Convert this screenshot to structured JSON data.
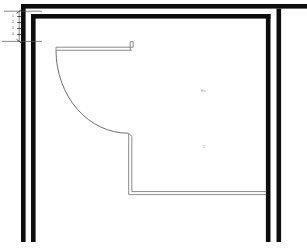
{
  "drawing": {
    "title": "architectural-floor-plan",
    "type": "plan-view",
    "background_color": "#ffffff",
    "wall_color": "#0d0d0d",
    "thin_line_color": "#8a8a8a",
    "dimension_color": "#4a4a4a"
  },
  "labels": {
    "room_tag_upper": "Ex",
    "room_tag_lower": "2"
  },
  "dimensions": {
    "vertical_note_1": "1",
    "vertical_note_2": "2",
    "vertical_note_3": "3",
    "vertical_note_4": "4"
  },
  "geometry": {
    "outer_wall_top_y": 4,
    "inner_wall_top_y": 14,
    "left_wall_outer_x": 21,
    "left_wall_inner_x": 31,
    "right_wall_inner_x": 265,
    "right_wall_outer_x": 276,
    "walls_bottom_y": 242,
    "door_arc_radius": 74,
    "partition_corner_x": 128,
    "partition_corner_y": 194
  }
}
